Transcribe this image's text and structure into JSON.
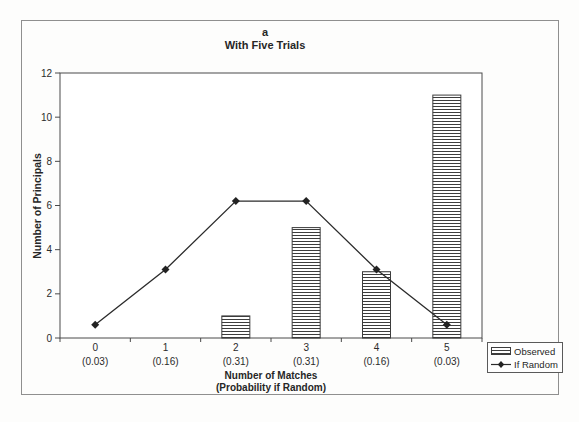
{
  "colors": {
    "ink": "#2b2b2b",
    "plot_border": "#4a4a4a",
    "frame_border": "#8f8f8f",
    "hatch": "#3d3d3d",
    "background": "#fdfdfc"
  },
  "chart_data": {
    "type": "bar",
    "title": "a",
    "subtitle": "With Five Trials",
    "categories": [
      "0",
      "1",
      "2",
      "3",
      "4",
      "5"
    ],
    "category_sublabels": [
      "(0.03)",
      "(0.16)",
      "(0.31)",
      "(0.31)",
      "(0.16)",
      "(0.03)"
    ],
    "series": [
      {
        "name": "Observed",
        "type": "bar",
        "values": [
          0,
          0,
          1,
          5,
          3,
          11
        ]
      },
      {
        "name": "If Random",
        "type": "line",
        "values": [
          0.6,
          3.1,
          6.2,
          6.2,
          3.1,
          0.6
        ]
      }
    ],
    "xlabel_line1": "Number of Matches",
    "xlabel_line2": "(Probability if Random)",
    "ylabel": "Number of Principals",
    "ylim": [
      0,
      12
    ],
    "yticks": [
      0,
      2,
      4,
      6,
      8,
      10,
      12
    ],
    "grid": false,
    "legend_position": "outside-bottom-right"
  }
}
